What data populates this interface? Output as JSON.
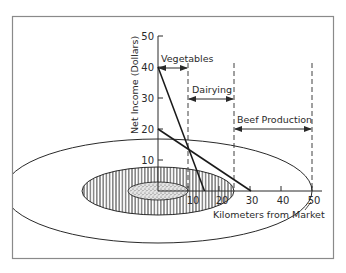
{
  "figure": {
    "y_axis": {
      "title": "Net Income (Dollars)",
      "ticks": [
        "10",
        "20",
        "30",
        "40",
        "50"
      ]
    },
    "x_axis": {
      "title": "Kilometers from Market",
      "ticks": [
        "10",
        "20",
        "30",
        "40",
        "50"
      ]
    },
    "zones": [
      {
        "label": "Vegetables",
        "from_km": 0,
        "to_km": 10
      },
      {
        "label": "Dairying",
        "from_km": 10,
        "to_km": 25
      },
      {
        "label": "Beef Production",
        "from_km": 25,
        "to_km": 50
      }
    ],
    "bid_rent_lines": [
      {
        "name": "vegetables-line",
        "start": [
          0,
          40
        ],
        "end": [
          15,
          0
        ]
      },
      {
        "name": "beef-line",
        "start": [
          0,
          20
        ],
        "end": [
          30,
          0
        ]
      }
    ],
    "rings": [
      {
        "name": "inner-ring",
        "fill": "stipple"
      },
      {
        "name": "middle-ring",
        "fill": "vertical-hatch"
      },
      {
        "name": "outer-ring",
        "fill": "none"
      }
    ],
    "colors": {
      "ink": "#2a2a2a",
      "frame": "#8a8a8a",
      "background": "#ffffff"
    }
  }
}
